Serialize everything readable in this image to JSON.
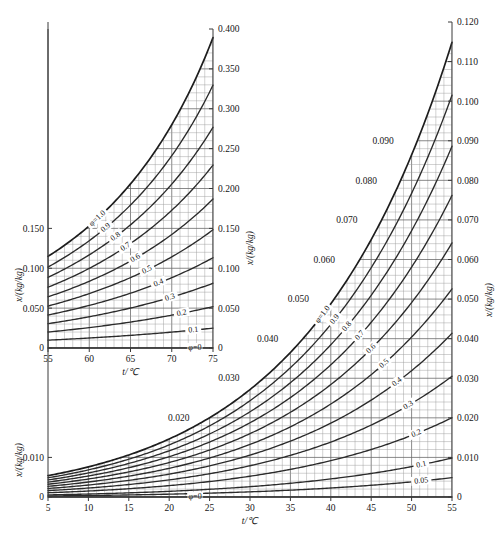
{
  "figure": {
    "background_color": "#ffffff",
    "curve_color": "#2b2b2b",
    "grid_color": "#9b9b9b",
    "axis_color": "#3a3a3a"
  },
  "chart_data": [
    {
      "id": "main",
      "type": "line",
      "title": "",
      "xlabel": "t/℃",
      "ylabel": "x/(kg/kg)",
      "ylabel_right": "x/(kg/kg)",
      "xlim": [
        5,
        55
      ],
      "ylim": [
        0,
        0.12
      ],
      "grid": true,
      "grid_major_x_step": 5,
      "grid_minor_x_step": 1,
      "grid_major_y_step": 0.01,
      "grid_minor_y_step": 0.002,
      "legend_position": "inline-curve-labels",
      "xticks": [
        5,
        10,
        15,
        20,
        25,
        30,
        35,
        40,
        45,
        50,
        55
      ],
      "xticklabels": [
        "5",
        "10",
        "15",
        "20",
        "25",
        "30",
        "35",
        "40",
        "45",
        "50",
        "55"
      ],
      "yticks": [
        0,
        0.01,
        0.02,
        0.03,
        0.04,
        0.05,
        0.06,
        0.07,
        0.08,
        0.09,
        0.1,
        0.11,
        0.12
      ],
      "yticklabels_left": [
        "0",
        "0.010"
      ],
      "yticklabels_right": [
        "0",
        "0.010",
        "0.020",
        "0.030",
        "0.040",
        "0.050",
        "0.060",
        "0.070",
        "0.080",
        "0.090",
        "0.100",
        "0.110",
        "0.120"
      ],
      "floating_gridvalue_labels": [
        {
          "text": "0.020",
          "t": 23.0,
          "x": 0.02
        },
        {
          "text": "0.030",
          "t": 29.2,
          "x": 0.03
        },
        {
          "text": "0.040",
          "t": 34.0,
          "x": 0.04
        },
        {
          "text": "0.050",
          "t": 37.8,
          "x": 0.05
        },
        {
          "text": "0.060",
          "t": 41.0,
          "x": 0.06
        },
        {
          "text": "0.070",
          "t": 43.8,
          "x": 0.07
        },
        {
          "text": "0.080",
          "t": 46.2,
          "x": 0.08
        },
        {
          "text": "0.090",
          "t": 48.3,
          "x": 0.09
        }
      ],
      "series": [
        {
          "name": "φ=1.0",
          "phi": 1.0,
          "label": "φ=1.0",
          "label_t": 39.0
        },
        {
          "name": "0.9",
          "phi": 0.9,
          "label": "0.9",
          "label_t": 40.5
        },
        {
          "name": "0.8",
          "phi": 0.8,
          "label": "0.8",
          "label_t": 42.0
        },
        {
          "name": "0.7",
          "phi": 0.7,
          "label": "0.7",
          "label_t": 43.6
        },
        {
          "name": "0.6",
          "phi": 0.6,
          "label": "0.6",
          "label_t": 45.0
        },
        {
          "name": "0.5",
          "phi": 0.5,
          "label": "0.5",
          "label_t": 46.6
        },
        {
          "name": "0.4",
          "phi": 0.4,
          "label": "0.4",
          "label_t": 48.2
        },
        {
          "name": "0.3",
          "phi": 0.3,
          "label": "0.3",
          "label_t": 49.6
        },
        {
          "name": "0.2",
          "phi": 0.2,
          "label": "0.2",
          "label_t": 50.6
        },
        {
          "name": "0.1",
          "phi": 0.1,
          "label": "0.1",
          "label_t": 51.2
        },
        {
          "name": "0.05",
          "phi": 0.05,
          "label": "0.05",
          "label_t": 51.2
        },
        {
          "name": "φ=0",
          "phi": 0.0,
          "label": "φ=0",
          "label_t": 23.2
        }
      ]
    },
    {
      "id": "inset",
      "type": "line",
      "title": "",
      "xlabel": "t/℃",
      "ylabel": "x/(kg/kg)",
      "ylabel_right": "x/(kg/kg)",
      "xlim": [
        55,
        75
      ],
      "ylim": [
        0,
        0.4
      ],
      "grid": true,
      "grid_major_x_step": 5,
      "grid_minor_x_step": 1,
      "grid_major_y_step": 0.05,
      "grid_minor_y_step": 0.01,
      "legend_position": "inline-curve-labels",
      "xticks": [
        55,
        60,
        65,
        70,
        75
      ],
      "xticklabels": [
        "55",
        "60",
        "65",
        "70",
        "75"
      ],
      "yticks": [
        0,
        0.05,
        0.1,
        0.15,
        0.2,
        0.25,
        0.3,
        0.35,
        0.4
      ],
      "yticklabels_left": [
        "0",
        "0.050",
        "0.100",
        "0.150"
      ],
      "yticklabels_right": [
        "0",
        "0.050",
        "0.100",
        "0.150",
        "0.200",
        "0.250",
        "0.300",
        "0.350",
        "0.400"
      ],
      "series": [
        {
          "name": "φ=1.0",
          "phi": 1.0,
          "label": "φ=1.0",
          "label_t": 61.0
        },
        {
          "name": "0.9",
          "phi": 0.9,
          "label": "0.9",
          "label_t": 62.0
        },
        {
          "name": "0.8",
          "phi": 0.8,
          "label": "0.8",
          "label_t": 63.2
        },
        {
          "name": "0.7",
          "phi": 0.7,
          "label": "0.7",
          "label_t": 64.4
        },
        {
          "name": "0.6",
          "phi": 0.6,
          "label": "0.6",
          "label_t": 65.6
        },
        {
          "name": "0.5",
          "phi": 0.5,
          "label": "0.5",
          "label_t": 67.0
        },
        {
          "name": "0.4",
          "phi": 0.4,
          "label": "0.4",
          "label_t": 68.4
        },
        {
          "name": "0.3",
          "phi": 0.3,
          "label": "0.3",
          "label_t": 69.8
        },
        {
          "name": "0.2",
          "phi": 0.2,
          "label": "0.2",
          "label_t": 71.2
        },
        {
          "name": "0.1",
          "phi": 0.1,
          "label": "0.1",
          "label_t": 72.6
        },
        {
          "name": "φ=0",
          "phi": 0.0,
          "label": "φ=0",
          "label_t": 72.8
        }
      ]
    }
  ]
}
